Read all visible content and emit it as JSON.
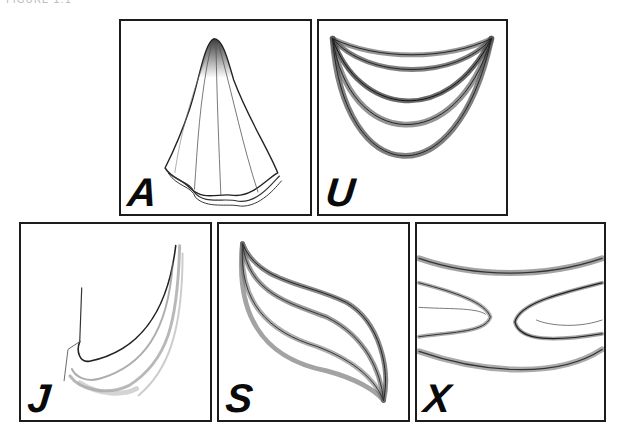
{
  "header": {
    "cropped_text": "FIGURE 1.1"
  },
  "panels": [
    {
      "id": "A",
      "label": "A",
      "description": "draped cloth hanging from a single point"
    },
    {
      "id": "U",
      "label": "U",
      "description": "U-shaped swag folds between two points"
    },
    {
      "id": "J",
      "label": "J",
      "description": "J-shaped drape hanging from one side"
    },
    {
      "id": "S",
      "label": "S",
      "description": "S-shaped twisting folds"
    },
    {
      "id": "X",
      "label": "X",
      "description": "X-shaped pinched folds"
    }
  ]
}
